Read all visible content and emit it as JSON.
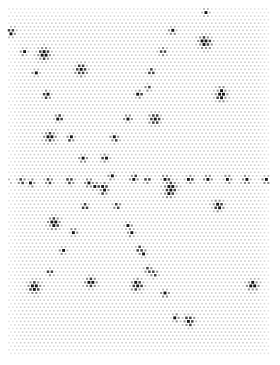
{
  "figure": {
    "title": "",
    "background_color": "#ffffff",
    "width": 280,
    "height": 365
  },
  "chart_data": {
    "type": "scatter",
    "title": "",
    "xlabel": "",
    "ylabel": "",
    "xlim": [
      0,
      280
    ],
    "ylim": [
      0,
      365
    ],
    "grid": false,
    "legend": null,
    "axis_visible": false,
    "tick_labels": [],
    "annotations": [],
    "lattice": {
      "name": "background-lattice",
      "marker": "square-dot",
      "color": "#d0d0d0",
      "dot_size": 1.7,
      "spacing_x": 3.9,
      "spacing_y": 3.55,
      "row_offset_x": 1.95,
      "origin_x": 9,
      "origin_y": 9,
      "extent_x": 270,
      "extent_y": 356,
      "edge_fade": true
    },
    "series": [
      {
        "name": "dark-clusters",
        "marker": "rosette",
        "color": "#111111",
        "halo_color": "#8a8a8a",
        "points": [
          {
            "x": 11,
            "y": 32,
            "r": 3.4
          },
          {
            "x": 206,
            "y": 12,
            "r": 2.4
          },
          {
            "x": 172,
            "y": 31,
            "r": 3.0
          },
          {
            "x": 24,
            "y": 52,
            "r": 2.6
          },
          {
            "x": 44,
            "y": 54,
            "r": 5.2
          },
          {
            "x": 205,
            "y": 42,
            "r": 5.4
          },
          {
            "x": 163,
            "y": 52,
            "r": 3.0
          },
          {
            "x": 81,
            "y": 70,
            "r": 4.8
          },
          {
            "x": 36,
            "y": 73,
            "r": 2.6
          },
          {
            "x": 151,
            "y": 72,
            "r": 2.9
          },
          {
            "x": 148,
            "y": 88,
            "r": 2.3
          },
          {
            "x": 221,
            "y": 90,
            "r": 3.0
          },
          {
            "x": 47,
            "y": 95,
            "r": 3.2
          },
          {
            "x": 139,
            "y": 94,
            "r": 2.8
          },
          {
            "x": 221,
            "y": 95,
            "r": 5.0
          },
          {
            "x": 59,
            "y": 118,
            "r": 3.0
          },
          {
            "x": 128,
            "y": 118,
            "r": 3.0
          },
          {
            "x": 155,
            "y": 119,
            "r": 4.8
          },
          {
            "x": 50,
            "y": 137,
            "r": 4.8
          },
          {
            "x": 71,
            "y": 138,
            "r": 2.9
          },
          {
            "x": 115,
            "y": 138,
            "r": 3.3
          },
          {
            "x": 83,
            "y": 159,
            "r": 3.0
          },
          {
            "x": 105,
            "y": 158,
            "r": 3.2
          },
          {
            "x": 6,
            "y": 182,
            "r": 2.6
          },
          {
            "x": 22,
            "y": 181,
            "r": 2.8
          },
          {
            "x": 31,
            "y": 183,
            "r": 2.8
          },
          {
            "x": 49,
            "y": 181,
            "r": 3.0
          },
          {
            "x": 70,
            "y": 181,
            "r": 3.0
          },
          {
            "x": 89,
            "y": 183,
            "r": 3.0
          },
          {
            "x": 96,
            "y": 186,
            "r": 2.8
          },
          {
            "x": 104,
            "y": 186,
            "r": 2.8
          },
          {
            "x": 112,
            "y": 176,
            "r": 2.6
          },
          {
            "x": 134,
            "y": 178,
            "r": 3.0
          },
          {
            "x": 147,
            "y": 180,
            "r": 2.6
          },
          {
            "x": 166,
            "y": 179,
            "r": 3.2
          },
          {
            "x": 171,
            "y": 187,
            "r": 5.2
          },
          {
            "x": 190,
            "y": 179,
            "r": 3.0
          },
          {
            "x": 208,
            "y": 179,
            "r": 2.8
          },
          {
            "x": 228,
            "y": 179,
            "r": 3.0
          },
          {
            "x": 246,
            "y": 180,
            "r": 3.0
          },
          {
            "x": 266,
            "y": 180,
            "r": 2.8
          },
          {
            "x": 104,
            "y": 191,
            "r": 3.3
          },
          {
            "x": 169,
            "y": 192,
            "r": 4.2
          },
          {
            "x": 85,
            "y": 206,
            "r": 2.7
          },
          {
            "x": 117,
            "y": 206,
            "r": 2.7
          },
          {
            "x": 218,
            "y": 206,
            "r": 4.4
          },
          {
            "x": 54,
            "y": 223,
            "r": 4.6
          },
          {
            "x": 74,
            "y": 232,
            "r": 2.9
          },
          {
            "x": 129,
            "y": 226,
            "r": 2.6
          },
          {
            "x": 131,
            "y": 233,
            "r": 2.9
          },
          {
            "x": 63,
            "y": 251,
            "r": 2.6
          },
          {
            "x": 140,
            "y": 249,
            "r": 2.8
          },
          {
            "x": 143,
            "y": 253,
            "r": 2.9
          },
          {
            "x": 50,
            "y": 272,
            "r": 2.6
          },
          {
            "x": 148,
            "y": 270,
            "r": 2.9
          },
          {
            "x": 154,
            "y": 274,
            "r": 2.8
          },
          {
            "x": 35,
            "y": 287,
            "r": 5.2
          },
          {
            "x": 91,
            "y": 283,
            "r": 4.4
          },
          {
            "x": 137,
            "y": 285,
            "r": 4.8
          },
          {
            "x": 165,
            "y": 294,
            "r": 2.8
          },
          {
            "x": 253,
            "y": 285,
            "r": 4.4
          },
          {
            "x": 176,
            "y": 318,
            "r": 2.6
          },
          {
            "x": 189,
            "y": 321,
            "r": 4.4
          }
        ]
      }
    ]
  }
}
